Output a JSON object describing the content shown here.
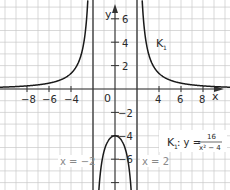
{
  "chart_data": {
    "type": "line",
    "title": "",
    "xlabel": "x",
    "ylabel": "y",
    "xlim": [
      -10.5,
      10.5
    ],
    "ylim": [
      -8.8,
      7.6
    ],
    "grid": true,
    "origin_label": "0",
    "x_ticks": [
      -8,
      -6,
      -4,
      4,
      6,
      8
    ],
    "x_tick_labels": [
      "−8",
      "−6",
      "−4",
      "4",
      "6",
      "8"
    ],
    "y_ticks": [
      6,
      4,
      2,
      -2,
      -4,
      -6,
      -8
    ],
    "y_tick_labels": [
      "6",
      "4",
      "2",
      "−2",
      "−4",
      "−6",
      ""
    ],
    "series": [
      {
        "name": "K_1",
        "function": "y = 16 / (x^2 - 4)",
        "branches": [
          {
            "domain": [
              -10.5,
              -2
            ],
            "sample_points": [
              [
                -10,
                0.167
              ],
              [
                -8,
                0.267
              ],
              [
                -6,
                0.5
              ],
              [
                -4,
                1.333
              ],
              [
                -3,
                3.2
              ],
              [
                -2.6,
                5.8
              ]
            ]
          },
          {
            "domain": [
              -2,
              2
            ],
            "sample_points": [
              [
                -1.6,
                -11.1
              ],
              [
                -1,
                -5.333
              ],
              [
                0,
                -4
              ],
              [
                1,
                -5.333
              ],
              [
                1.6,
                -11.1
              ]
            ]
          },
          {
            "domain": [
              2,
              10.5
            ],
            "sample_points": [
              [
                2.6,
                5.8
              ],
              [
                3,
                3.2
              ],
              [
                4,
                1.333
              ],
              [
                6,
                0.5
              ],
              [
                8,
                0.267
              ],
              [
                10,
                0.167
              ]
            ]
          }
        ]
      }
    ],
    "asymptotes": [
      {
        "type": "vertical",
        "x": -2,
        "label": "x = −2"
      },
      {
        "type": "vertical",
        "x": 2,
        "label": "x = 2"
      },
      {
        "type": "horizontal",
        "y": 0
      }
    ],
    "annotations": [
      {
        "text": "K",
        "subscript": "1",
        "position": [
          1.8,
          4
        ]
      },
      {
        "text": "K",
        "subscript": "1",
        "suffix": ": y = ",
        "fraction": {
          "numerator": "16",
          "denominator": "x² − 4"
        },
        "position": [
          4,
          -5
        ]
      }
    ]
  },
  "labels": {
    "x_axis": "x",
    "y_axis": "y",
    "origin": "0",
    "curve_name": "K",
    "curve_sub": "1",
    "eq_prefix": "K",
    "eq_sub": "1",
    "eq_mid": ": y =",
    "eq_num": "16",
    "eq_den": "x² − 4",
    "asym_left": "x = −2",
    "asym_right": "x = 2",
    "xt": [
      "−8",
      "−6",
      "−4",
      "4",
      "6",
      "8"
    ],
    "yt": [
      "6",
      "4",
      "2",
      "−2",
      "−4",
      "−6"
    ]
  },
  "colors": {
    "grid": "#c8c8c8",
    "axis": "#333333",
    "curve": "#1a1a1a",
    "asymptote": "#555555",
    "annotation_gray": "#8a8a8a"
  }
}
